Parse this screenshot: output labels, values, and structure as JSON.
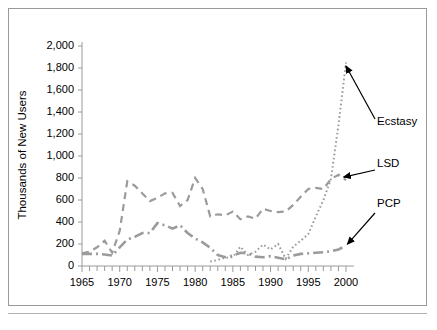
{
  "chart_data": {
    "type": "line",
    "title": "",
    "xlabel": "",
    "ylabel": "Thousands of New Users",
    "xlim": [
      1965,
      2000
    ],
    "ylim": [
      0,
      2000
    ],
    "ytick_values": [
      0,
      200,
      400,
      600,
      800,
      1000,
      1200,
      1400,
      1600,
      1800,
      2000
    ],
    "ytick_labels": [
      "0",
      "200",
      "400",
      "600",
      "800",
      "1,000",
      "1,200",
      "1,400",
      "1,600",
      "1,800",
      "2,000"
    ],
    "xtick_values": [
      1965,
      1970,
      1975,
      1980,
      1985,
      1990,
      1995,
      2000
    ],
    "xtick_labels": [
      "1965",
      "1970",
      "1975",
      "1980",
      "1985",
      "1990",
      "1995",
      "2000"
    ],
    "minor_xticks_every": 1,
    "grid": false,
    "legend": "annotations-with-arrows",
    "line_color": "#9b9b9b",
    "series": [
      {
        "name": "LSD",
        "dash": "dashed",
        "x": [
          1965,
          1966,
          1967,
          1968,
          1969,
          1970,
          1971,
          1972,
          1973,
          1974,
          1975,
          1976,
          1977,
          1978,
          1979,
          1980,
          1981,
          1982,
          1983,
          1984,
          1985,
          1986,
          1987,
          1988,
          1989,
          1990,
          1991,
          1992,
          1993,
          1994,
          1995,
          1996,
          1997,
          1998,
          1999,
          2000
        ],
        "values": [
          115,
          130,
          170,
          230,
          120,
          320,
          770,
          730,
          660,
          590,
          620,
          660,
          665,
          545,
          600,
          800,
          700,
          450,
          470,
          460,
          495,
          425,
          450,
          430,
          520,
          500,
          490,
          495,
          555,
          630,
          700,
          710,
          700,
          790,
          830,
          780
        ]
      },
      {
        "name": "PCP",
        "dash": "dashdot",
        "x": [
          1965,
          1966,
          1967,
          1968,
          1969,
          1970,
          1971,
          1972,
          1973,
          1974,
          1975,
          1976,
          1977,
          1978,
          1979,
          1980,
          1981,
          1982,
          1983,
          1984,
          1985,
          1986,
          1987,
          1988,
          1989,
          1990,
          1991,
          1992,
          1993,
          1994,
          1995,
          1996,
          1997,
          1998,
          1999,
          2000
        ],
        "values": [
          110,
          110,
          110,
          105,
          95,
          170,
          240,
          265,
          300,
          300,
          390,
          370,
          340,
          370,
          300,
          250,
          215,
          165,
          100,
          80,
          95,
          120,
          115,
          85,
          80,
          90,
          75,
          60,
          95,
          110,
          115,
          120,
          125,
          135,
          150,
          185
        ]
      },
      {
        "name": "Ecstasy",
        "dash": "dotted",
        "x": [
          1982,
          1983,
          1984,
          1985,
          1986,
          1987,
          1988,
          1989,
          1990,
          1991,
          1992,
          1993,
          1994,
          1995,
          1996,
          1997,
          1998,
          1999,
          2000
        ],
        "values": [
          40,
          55,
          75,
          80,
          175,
          100,
          130,
          195,
          150,
          200,
          65,
          175,
          230,
          290,
          450,
          600,
          790,
          1280,
          1850
        ]
      }
    ],
    "annotations": [
      {
        "label": "Ecstasy",
        "target_x": 1999.6,
        "target_y": 1800
      },
      {
        "label": "LSD",
        "target_x": 1999.3,
        "target_y": 790
      },
      {
        "label": "PCP",
        "target_x": 1999.8,
        "target_y": 180
      }
    ]
  }
}
